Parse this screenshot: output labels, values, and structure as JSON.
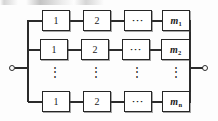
{
  "figure": {
    "line_color": "#2b2b2b",
    "block_border_color": "#262626",
    "background_color": "#ffffff"
  },
  "terminals": {
    "left_label": "",
    "right_label": ""
  },
  "columns": [
    {
      "key": "col1",
      "label": "1"
    },
    {
      "key": "col2",
      "label": "2"
    },
    {
      "key": "col3",
      "label": "···"
    },
    {
      "key": "col4",
      "label": "m"
    }
  ],
  "rows": [
    {
      "key": "row1",
      "blocks": [
        {
          "label": "1",
          "italic": false,
          "sub": ""
        },
        {
          "label": "2",
          "italic": false,
          "sub": ""
        },
        {
          "label": "···",
          "italic": false,
          "sub": ""
        },
        {
          "label": "m",
          "italic": true,
          "sub": "1"
        }
      ]
    },
    {
      "key": "row2",
      "blocks": [
        {
          "label": "1",
          "italic": false,
          "sub": ""
        },
        {
          "label": "2",
          "italic": false,
          "sub": ""
        },
        {
          "label": "···",
          "italic": false,
          "sub": ""
        },
        {
          "label": "m",
          "italic": true,
          "sub": "2"
        }
      ]
    },
    {
      "key": "row3",
      "blocks": [
        {
          "label": "1",
          "italic": false,
          "sub": ""
        },
        {
          "label": "2",
          "italic": false,
          "sub": ""
        },
        {
          "label": "···",
          "italic": false,
          "sub": ""
        },
        {
          "label": "m",
          "italic": true,
          "sub": "n"
        }
      ]
    }
  ],
  "ellipsis_row": {
    "glyph": "⋮",
    "count": 4
  }
}
